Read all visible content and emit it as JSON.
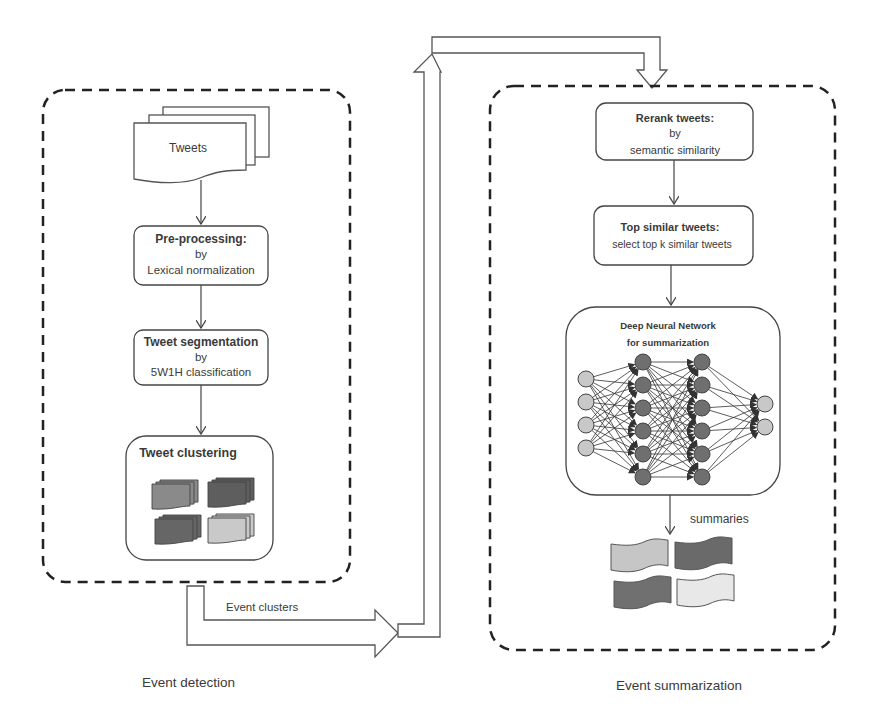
{
  "event_detection": {
    "section_label": "Event detection",
    "tweets_label": "Tweets",
    "preprocessing": {
      "title": "Pre-processing:",
      "by": "by",
      "method": "Lexical normalization"
    },
    "segmentation": {
      "title": "Tweet segmentation",
      "by": "by",
      "method": "5W1H classification"
    },
    "clustering": {
      "title": "Tweet clustering",
      "cluster_colors": [
        "#8a8a8a",
        "#5e5e5e",
        "#666666",
        "#c9c9c9"
      ]
    }
  },
  "transfer": {
    "label": "Event clusters"
  },
  "event_summarization": {
    "section_label": "Event summarization",
    "rerank": {
      "title": "Rerank tweets:",
      "by": "by",
      "method": "semantic similarity"
    },
    "top_similar": {
      "title": "Top similar tweets:",
      "method": "select top k similar tweets"
    },
    "dnn": {
      "title_line1": "Deep Neural Network",
      "title_line2": "for summarization",
      "layers": [
        4,
        6,
        6,
        2
      ],
      "io_color": "#c8c8c8",
      "hidden_color": "#6f6f6f"
    },
    "summaries_label": "summaries",
    "summary_colors": [
      "#c6c6c6",
      "#6a6a6a",
      "#707070",
      "#e8e8e8"
    ]
  }
}
